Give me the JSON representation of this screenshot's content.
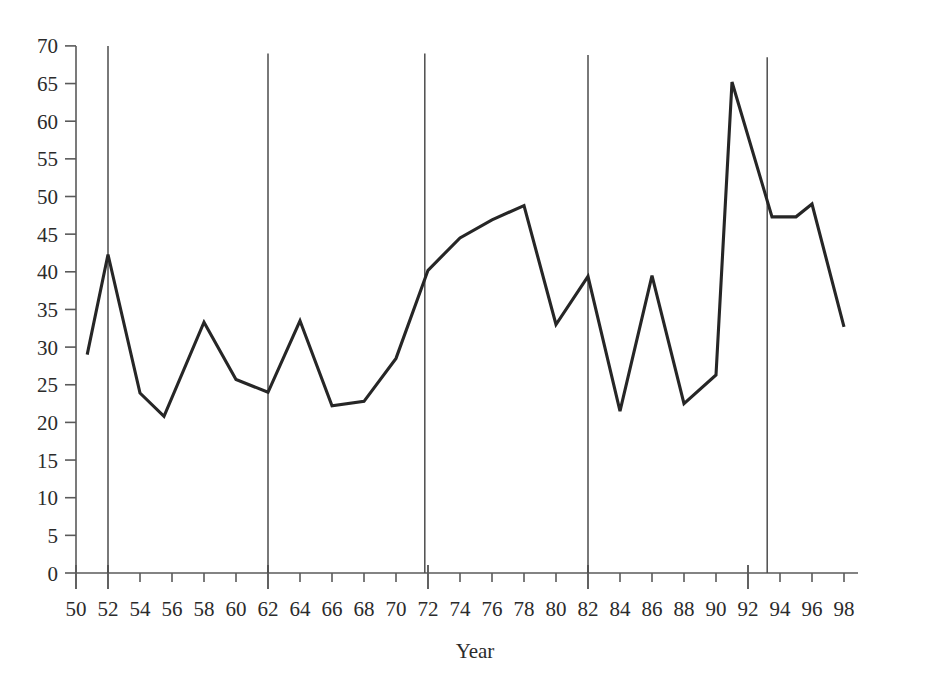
{
  "chart_data": {
    "type": "line",
    "title": "",
    "subtitle": "",
    "xlabel": "Year",
    "ylabel": "",
    "xlim": [
      49,
      99
    ],
    "ylim": [
      0,
      70
    ],
    "grid": false,
    "legend": "none",
    "x_tick_labels": [
      "50",
      "52",
      "54",
      "56",
      "58",
      "60",
      "62",
      "64",
      "66",
      "68",
      "70",
      "72",
      "74",
      "76",
      "78",
      "80",
      "82",
      "84",
      "86",
      "88",
      "90",
      "92",
      "94",
      "96",
      "98"
    ],
    "x_ticks": [
      50,
      52,
      54,
      56,
      58,
      60,
      62,
      64,
      66,
      68,
      70,
      72,
      74,
      76,
      78,
      80,
      82,
      84,
      86,
      88,
      90,
      92,
      94,
      96,
      98
    ],
    "x_major_ticks": [
      50,
      52,
      62,
      72,
      82,
      92
    ],
    "y_tick_labels": [
      "0",
      "5",
      "10",
      "15",
      "20",
      "25",
      "30",
      "35",
      "40",
      "45",
      "50",
      "55",
      "60",
      "65",
      "70"
    ],
    "y_ticks": [
      0,
      5,
      10,
      15,
      20,
      25,
      30,
      35,
      40,
      45,
      50,
      55,
      60,
      65,
      70
    ],
    "x": [
      50.7,
      52,
      54,
      55.5,
      58,
      60,
      62,
      64,
      66,
      68,
      70,
      72,
      74,
      76,
      78,
      80,
      82,
      84,
      86,
      88,
      90,
      91,
      93.5,
      95,
      96,
      98
    ],
    "values": [
      29.0,
      42.3,
      23.9,
      20.8,
      33.3,
      25.7,
      24.0,
      33.5,
      22.2,
      22.8,
      28.5,
      40.2,
      44.5,
      46.9,
      48.8,
      33.0,
      39.4,
      21.5,
      39.5,
      22.5,
      26.3,
      65.2,
      47.3,
      47.3,
      49.0,
      32.7
    ],
    "series": [
      {
        "name": "series-1",
        "color": "#262626",
        "points": [
          [
            50.7,
            29.0
          ],
          [
            52.0,
            42.3
          ],
          [
            54.0,
            23.9
          ],
          [
            55.5,
            20.8
          ],
          [
            58.0,
            33.3
          ],
          [
            60.0,
            25.7
          ],
          [
            62.0,
            24.0
          ],
          [
            64.0,
            33.5
          ],
          [
            66.0,
            22.2
          ],
          [
            68.0,
            22.8
          ],
          [
            70.0,
            28.5
          ],
          [
            72.0,
            40.2
          ],
          [
            74.0,
            44.5
          ],
          [
            76.0,
            46.9
          ],
          [
            78.0,
            48.8
          ],
          [
            80.0,
            33.0
          ],
          [
            82.0,
            39.4
          ],
          [
            84.0,
            21.5
          ],
          [
            86.0,
            39.5
          ],
          [
            88.0,
            22.5
          ],
          [
            90.0,
            26.3
          ],
          [
            91.0,
            65.2
          ],
          [
            93.5,
            47.3
          ],
          [
            95.0,
            47.3
          ],
          [
            96.0,
            49.0
          ],
          [
            98.0,
            32.7
          ]
        ]
      }
    ],
    "annotations": [
      {
        "name": "event-line-52",
        "x": 52,
        "y_top": 70.0,
        "label": ""
      },
      {
        "name": "event-line-62",
        "x": 62,
        "y_top": 69.0,
        "label": ""
      },
      {
        "name": "event-line-72",
        "x": 71.8,
        "y_top": 69.0,
        "label": ""
      },
      {
        "name": "event-line-82",
        "x": 82,
        "y_top": 68.8,
        "label": ""
      },
      {
        "name": "event-line-93",
        "x": 93.2,
        "y_top": 68.5,
        "label": ""
      }
    ]
  }
}
